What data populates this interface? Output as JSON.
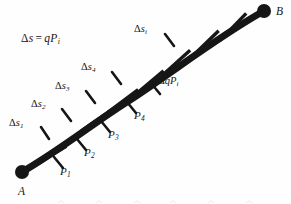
{
  "figure": {
    "name": "arc-subdivision-diagram",
    "background_color": "#fefefe",
    "ink_color": "#161616",
    "curve": {
      "description": "thick curved arc rising from lower-left endpoint A to upper-right endpoint B, crossed by short tick marks that divide it into segments",
      "stroke_width_px": 7,
      "path": "M 22,172 C 60,150 92,124 130,100 C 170,74 222,34 264,11"
    },
    "endpoints": [
      {
        "id": "A",
        "label": "A",
        "dot_x": 22,
        "dot_y": 172,
        "dot_r": 7,
        "label_x": 18,
        "label_y": 186
      },
      {
        "id": "B",
        "label": "B",
        "dot_x": 264,
        "dot_y": 11,
        "dot_r": 7,
        "label_x": 276,
        "label_y": 6
      }
    ],
    "ticks": [
      {
        "id": "tick-1",
        "x": 50,
        "y": 156,
        "angle_deg": -31,
        "length": 38
      },
      {
        "id": "tick-2",
        "x": 73,
        "y": 138,
        "angle_deg": -33,
        "length": 38
      },
      {
        "id": "tick-3",
        "x": 97,
        "y": 120,
        "angle_deg": -35,
        "length": 38
      },
      {
        "id": "tick-4",
        "x": 123,
        "y": 101,
        "angle_deg": -37,
        "length": 38
      },
      {
        "id": "tick-5",
        "x": 149,
        "y": 83,
        "angle_deg": -40,
        "length": 38
      },
      {
        "id": "tick-6",
        "x": 176,
        "y": 63,
        "angle_deg": -42,
        "length": 38
      },
      {
        "id": "tick-7",
        "x": 205,
        "y": 44,
        "angle_deg": -44,
        "length": 38
      },
      {
        "id": "tick-8",
        "x": 233,
        "y": 27,
        "angle_deg": -46,
        "length": 38
      }
    ],
    "leaders": [
      {
        "id": "leader-ds1",
        "x1": 41,
        "y1": 127,
        "x2": 49,
        "y2": 139
      },
      {
        "id": "leader-ds2",
        "x1": 62,
        "y1": 109,
        "x2": 71,
        "y2": 121
      },
      {
        "id": "leader-ds3",
        "x1": 86,
        "y1": 91,
        "x2": 95,
        "y2": 103
      },
      {
        "id": "leader-ds4",
        "x1": 112,
        "y1": 72,
        "x2": 121,
        "y2": 84
      },
      {
        "id": "leader-dsi",
        "x1": 165,
        "y1": 34,
        "x2": 174,
        "y2": 46
      },
      {
        "id": "leader-p1",
        "x1": 63,
        "y1": 168,
        "x2": 54,
        "y2": 157
      },
      {
        "id": "leader-p2",
        "x1": 86,
        "y1": 150,
        "x2": 77,
        "y2": 139
      },
      {
        "id": "leader-p3",
        "x1": 110,
        "y1": 132,
        "x2": 101,
        "y2": 121
      },
      {
        "id": "leader-p4",
        "x1": 136,
        "y1": 113,
        "x2": 127,
        "y2": 102
      },
      {
        "id": "leader-dqpi",
        "x1": 160,
        "y1": 94,
        "x2": 151,
        "y2": 83
      }
    ],
    "equation": {
      "id": "equation-delta-s",
      "text": "Δs = qP",
      "delta": "Δ",
      "lhs_var": "s",
      "operator": "=",
      "rhs": "qP",
      "rhs_subscript": "i",
      "x": 21,
      "y": 33
    },
    "point_labels": [
      {
        "id": "label-P1",
        "base": "P",
        "sub": "1",
        "x": 60,
        "y": 166
      },
      {
        "id": "label-P2",
        "base": "P",
        "sub": "2",
        "x": 84,
        "y": 147
      },
      {
        "id": "label-P3",
        "base": "P",
        "sub": "3",
        "x": 108,
        "y": 129
      },
      {
        "id": "label-P4",
        "base": "P",
        "sub": "4",
        "x": 134,
        "y": 110
      }
    ],
    "segment_labels": [
      {
        "id": "label-ds1",
        "delta": "Δ",
        "base": "s",
        "sub": "1",
        "x": 9,
        "y": 118
      },
      {
        "id": "label-ds2",
        "delta": "Δ",
        "base": "s",
        "sub": "2",
        "x": 31,
        "y": 99
      },
      {
        "id": "label-ds3",
        "delta": "Δ",
        "base": "s",
        "sub": "3",
        "x": 55,
        "y": 81
      },
      {
        "id": "label-ds4",
        "delta": "Δ",
        "base": "s",
        "sub": "4",
        "x": 81,
        "y": 62
      },
      {
        "id": "label-dsi",
        "delta": "Δ",
        "base": "s",
        "sub": "i",
        "x": 134,
        "y": 24
      }
    ],
    "annotation_labels": [
      {
        "id": "label-dqpi",
        "delta": "Δ",
        "base": "qP",
        "sub": "i",
        "x": 158,
        "y": 76
      }
    ]
  }
}
